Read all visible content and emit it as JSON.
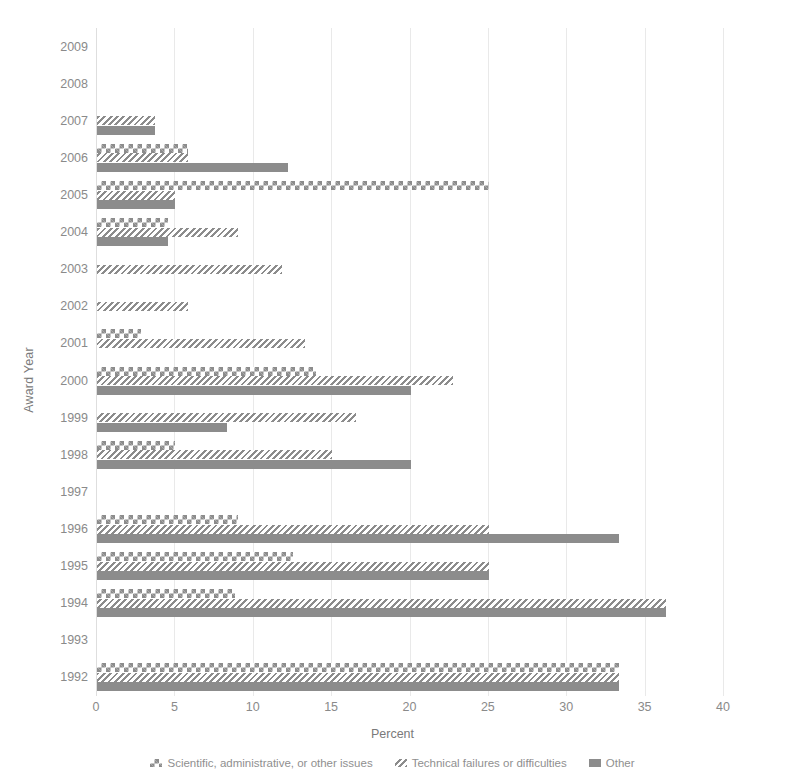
{
  "chart_data": {
    "type": "bar",
    "orientation": "horizontal",
    "title": "",
    "xlabel": "Percent",
    "ylabel": "Award Year",
    "xlim": [
      0,
      40
    ],
    "xticks": [
      0,
      5,
      10,
      15,
      20,
      25,
      30,
      35,
      40
    ],
    "grid": true,
    "legend_position": "bottom",
    "categories": [
      "2009",
      "2008",
      "2007",
      "2006",
      "2005",
      "2004",
      "2003",
      "2002",
      "2001",
      "2000",
      "1999",
      "1998",
      "1997",
      "1996",
      "1995",
      "1994",
      "1993",
      "1992"
    ],
    "series": [
      {
        "name": "Scientific, administrative, or other issues",
        "pattern": "check",
        "color": "#8c8c8c",
        "values": [
          0,
          0,
          0,
          5.8,
          25.0,
          4.5,
          0,
          0,
          2.8,
          14.0,
          0,
          5.0,
          0,
          9.0,
          12.5,
          8.8,
          0,
          33.3
        ]
      },
      {
        "name": "Technical failures or difficulties",
        "pattern": "hatch",
        "color": "#8c8c8c",
        "values": [
          0,
          0,
          3.7,
          5.8,
          5.0,
          9.0,
          11.8,
          5.8,
          13.3,
          22.7,
          16.5,
          15.0,
          0,
          25.0,
          25.0,
          36.3,
          0,
          33.3
        ]
      },
      {
        "name": "Other",
        "pattern": "solid",
        "color": "#8c8c8c",
        "values": [
          0,
          0,
          3.7,
          12.2,
          5.0,
          4.5,
          0,
          0,
          0,
          20.0,
          8.3,
          20.0,
          0,
          33.3,
          25.0,
          36.3,
          0,
          33.3
        ]
      }
    ]
  },
  "axes": {
    "x_title": "Percent",
    "y_title": "Award Year",
    "x_tick_labels": [
      "0",
      "5",
      "10",
      "15",
      "20",
      "25",
      "30",
      "35",
      "40"
    ],
    "y_tick_labels": [
      "2009",
      "2008",
      "2007",
      "2006",
      "2005",
      "2004",
      "2003",
      "2002",
      "2001",
      "2000",
      "1999",
      "1998",
      "1997",
      "1996",
      "1995",
      "1994",
      "1993",
      "1992"
    ]
  },
  "legend": {
    "items": [
      {
        "label": "Scientific, administrative, or other issues",
        "pattern": "check"
      },
      {
        "label": "Technical failures or difficulties",
        "pattern": "hatch"
      },
      {
        "label": "Other",
        "pattern": "solid"
      }
    ]
  },
  "style": {
    "bar_color": "#8c8c8c",
    "grid_color": "#e9e9e9",
    "text_color": "#8a8a8a",
    "background": "#ffffff"
  }
}
